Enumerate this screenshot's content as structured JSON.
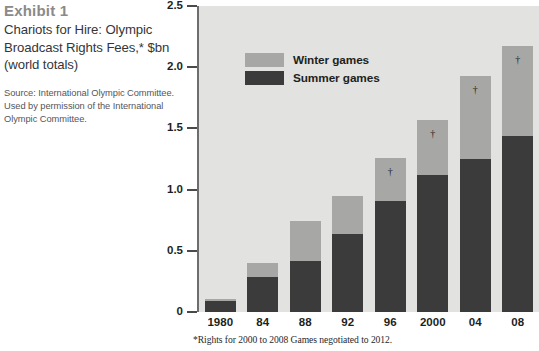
{
  "exhibit": {
    "label": "Exhibit 1",
    "title": "Chariots for Hire: Olympic Broadcast Rights Fees,* $bn (world totals)",
    "source": "Source: International Olympic Committee. Used by permission of the International Olympic Committee."
  },
  "footnote": "*Rights for 2000 to 2008 Games negotiated to 2012.",
  "legend": {
    "position": "inside-top-left",
    "items": [
      {
        "label": "Winter games",
        "color": "#a7a7a5"
      },
      {
        "label": "Summer games",
        "color": "#3b3b3b"
      }
    ]
  },
  "colors": {
    "winter": "#a7a7a5",
    "summer": "#3b3b3b",
    "plot_background": "#e2e2e0",
    "exhibit_label": "#8a8a8a",
    "title_text": "#33363b",
    "axis": "#6d6d6d"
  },
  "chart_data": {
    "type": "bar",
    "title": "Chariots for Hire: Olympic Broadcast Rights Fees,* $bn (world totals)",
    "xlabel": "",
    "ylabel": "",
    "ylim": [
      0,
      2.5
    ],
    "yticks": [
      "0",
      "0.5",
      "1.0",
      "1.5",
      "2.0",
      "2.5"
    ],
    "ytick_values": [
      0,
      0.5,
      1.0,
      1.5,
      2.0,
      2.5
    ],
    "grid": false,
    "stacked": true,
    "categories": [
      "1980",
      "84",
      "88",
      "92",
      "96",
      "2000",
      "04",
      "08"
    ],
    "series": [
      {
        "name": "Summer games",
        "color": "#3b3b3b",
        "values": [
          0.09,
          0.29,
          0.42,
          0.64,
          0.91,
          1.12,
          1.25,
          1.44
        ]
      },
      {
        "name": "Winter games",
        "color": "#a7a7a5",
        "values": [
          0.02,
          0.11,
          0.32,
          0.31,
          0.35,
          0.45,
          0.68,
          0.73
        ]
      }
    ],
    "totals": [
      0.11,
      0.4,
      0.74,
      0.95,
      1.26,
      1.57,
      1.93,
      2.17
    ],
    "annotations": [
      {
        "category": "96",
        "symbol": "†"
      },
      {
        "category": "2000",
        "symbol": "†"
      },
      {
        "category": "04",
        "symbol": "†"
      },
      {
        "category": "08",
        "symbol": "†"
      }
    ]
  }
}
